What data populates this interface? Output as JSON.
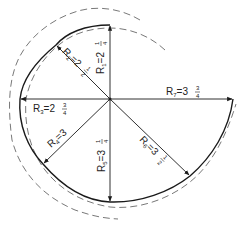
{
  "diagram": {
    "type": "spiral construction with radii",
    "center": {
      "x": 110,
      "y": 99
    },
    "radii": [
      {
        "id": "R1",
        "label": "R",
        "sub": "1",
        "eq": "=2",
        "num": "1",
        "den": "4",
        "value": "2 1/4",
        "angle_deg": 90
      },
      {
        "id": "R2",
        "label": "R",
        "sub": "2",
        "eq": "=2",
        "num": "1",
        "den": "2",
        "value": "2 1/2",
        "angle_deg": 135
      },
      {
        "id": "R3",
        "label": "R",
        "sub": "3",
        "eq": "=2",
        "num": "3",
        "den": "4",
        "value": "2 3/4",
        "angle_deg": 180
      },
      {
        "id": "R4",
        "label": "R",
        "sub": "4",
        "eq": "=3",
        "num": "",
        "den": "",
        "value": "3",
        "angle_deg": 225
      },
      {
        "id": "R5",
        "label": "R",
        "sub": "5",
        "eq": "=3",
        "num": "1",
        "den": "4",
        "value": "3 1/4",
        "angle_deg": 270
      },
      {
        "id": "R6",
        "label": "R",
        "sub": "6",
        "eq": "=3",
        "num": "1",
        "den": "2",
        "value": "3 1/2",
        "angle_deg": 315
      },
      {
        "id": "R7",
        "label": "R",
        "sub": "7",
        "eq": "=3",
        "num": "3",
        "den": "4",
        "value": "3 3/4",
        "angle_deg": 0
      }
    ],
    "colors": {
      "line": "#1a1a1a",
      "dashed": "#555555",
      "background": "#ffffff"
    }
  }
}
